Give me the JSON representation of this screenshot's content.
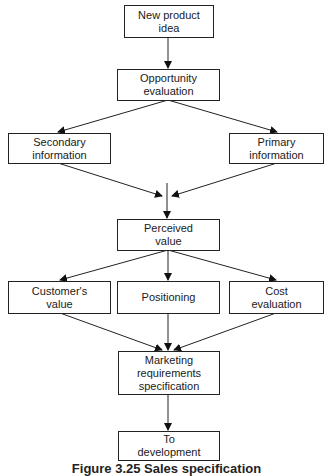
{
  "diagram": {
    "nodes": {
      "new_product_idea": {
        "line1": "New product",
        "line2": "idea"
      },
      "opportunity_evaluation": {
        "line1": "Opportunity",
        "line2": "evaluation"
      },
      "secondary_information": {
        "line1": "Secondary",
        "line2": "information"
      },
      "primary_information": {
        "line1": "Primary",
        "line2": "information"
      },
      "perceived_value": {
        "line1": "Perceived",
        "line2": "value"
      },
      "customers_value": {
        "line1": "Customer's",
        "line2": "value"
      },
      "positioning": {
        "line1": "Positioning"
      },
      "cost_evaluation": {
        "line1": "Cost",
        "line2": "evaluation"
      },
      "marketing_requirements_specification": {
        "line1": "Marketing",
        "line2": "requirements",
        "line3": "specification"
      },
      "to_development": {
        "line1": "To",
        "line2": "development"
      }
    },
    "edges": [
      {
        "from": "New product idea",
        "to": "Opportunity evaluation"
      },
      {
        "from": "Opportunity evaluation",
        "to": "Secondary information"
      },
      {
        "from": "Opportunity evaluation",
        "to": "Primary information"
      },
      {
        "from": "Secondary information",
        "to": "Perceived value"
      },
      {
        "from": "Primary information",
        "to": "Perceived value"
      },
      {
        "from": "Perceived value",
        "to": "Customer's value"
      },
      {
        "from": "Perceived value",
        "to": "Positioning"
      },
      {
        "from": "Perceived value",
        "to": "Cost evaluation"
      },
      {
        "from": "Customer's value",
        "to": "Marketing requirements specification"
      },
      {
        "from": "Positioning",
        "to": "Marketing requirements specification"
      },
      {
        "from": "Cost evaluation",
        "to": "Marketing requirements specification"
      },
      {
        "from": "Marketing requirements specification",
        "to": "To development"
      }
    ],
    "caption": "Figure 3.25  Sales specification"
  }
}
